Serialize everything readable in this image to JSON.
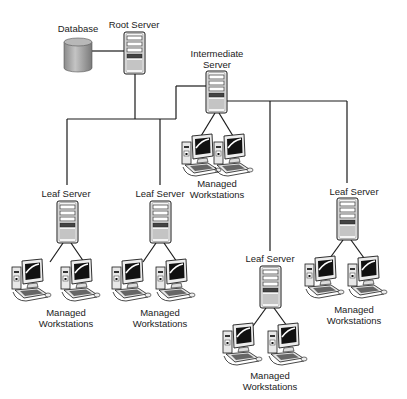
{
  "diagram": {
    "colors": {
      "line": "#1a1a1a",
      "server_body": "#f2f2f2",
      "db_fill": "#a8a8a8"
    },
    "nodes": {
      "database": {
        "label": "Database",
        "icon": "database-icon"
      },
      "root": {
        "label": "Root Server",
        "icon": "server-icon"
      },
      "intermediate": {
        "label": "Intermediate Server",
        "line1": "Intermediate",
        "line2": "Server",
        "icon": "server-icon"
      },
      "leaf1": {
        "label": "Leaf Server",
        "icon": "server-icon"
      },
      "leaf2": {
        "label": "Leaf Server",
        "icon": "server-icon"
      },
      "leaf3": {
        "label": "Leaf Server",
        "icon": "server-icon"
      },
      "leaf4": {
        "label": "Leaf Server",
        "icon": "server-icon"
      }
    },
    "workstation_groups": {
      "intermediate": {
        "line1": "Managed",
        "line2": "Workstations",
        "count": 2
      },
      "leaf1": {
        "line1": "Managed",
        "line2": "Workstations",
        "count": 2
      },
      "leaf2": {
        "line1": "Managed",
        "line2": "Workstations",
        "count": 2
      },
      "leaf3": {
        "line1": "Managed",
        "line2": "Workstations",
        "count": 2
      },
      "leaf4": {
        "line1": "Managed",
        "line2": "Workstations",
        "count": 2
      }
    }
  }
}
